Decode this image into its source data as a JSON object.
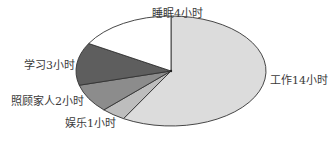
{
  "chart_data": {
    "type": "pie",
    "title": "",
    "unit": "小时",
    "total": 24,
    "start_angle_deg": 0,
    "direction": "clockwise",
    "slices": [
      {
        "label": "工作14小时",
        "name": "工作",
        "value": 14,
        "color": "#dcdcdc"
      },
      {
        "label": "娱乐1小时",
        "name": "娱乐",
        "value": 1,
        "color": "#bdbdbd"
      },
      {
        "label": "照顾家人2小时",
        "name": "照顾家人",
        "value": 2,
        "color": "#8c8c8c"
      },
      {
        "label": "学习3小时",
        "name": "学习",
        "value": 3,
        "color": "#5e5e5e"
      },
      {
        "label": "睡眠4小时",
        "name": "睡眠",
        "value": 4,
        "color": "#ffffff"
      }
    ],
    "legend": "none (labels placed next to slices)"
  },
  "labels": {
    "work": "工作14小时",
    "fun": "娱乐1小时",
    "family": "照顾家人2小时",
    "study": "学习3小时",
    "sleep": "睡眠4小时"
  }
}
